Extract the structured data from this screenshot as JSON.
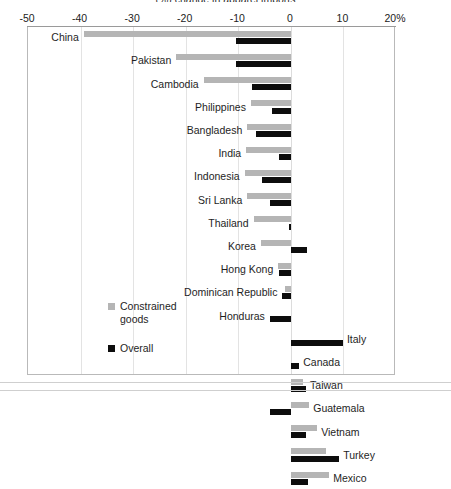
{
  "chart_data": {
    "type": "bar",
    "orientation": "horizontal",
    "title": "(%) change in apparel imports",
    "xlabel": "",
    "ylabel": "",
    "xlim": [
      -50,
      20
    ],
    "xticks": [
      -50,
      -40,
      -30,
      -20,
      -10,
      0,
      10,
      20
    ],
    "xticklabels": [
      "-50",
      "-40",
      "-30",
      "-20",
      "-10",
      "0",
      "10",
      "20%"
    ],
    "grid": "vertical",
    "legend_position": "inside-lower-left",
    "categories": [
      "China",
      "Pakistan",
      "Cambodia",
      "Philippines",
      "Bangladesh",
      "India",
      "Indonesia",
      "Sri Lanka",
      "Thailand",
      "Korea",
      "Hong Kong",
      "Dominican Republic",
      "Honduras",
      "Italy",
      "Canada",
      "Taiwan",
      "Guatemala",
      "Vietnam",
      "Turkey",
      "Mexico"
    ],
    "series": [
      {
        "name": "Constrained goods",
        "color": "#b5b5b5",
        "values": [
          -39.4,
          -21.8,
          -16.6,
          -7.6,
          -8.3,
          -8.5,
          -8.8,
          -8.3,
          -7.1,
          -5.7,
          -2.4,
          -1.2,
          0.0,
          0.0,
          0.0,
          2.4,
          3.5,
          5.0,
          6.6,
          7.3
        ]
      },
      {
        "name": "Overall",
        "color": "#0d0d0d",
        "values": [
          -10.4,
          -10.4,
          -7.3,
          -3.6,
          -6.7,
          -2.2,
          -5.5,
          -4.0,
          -0.3,
          3.1,
          -2.2,
          -1.6,
          -4.0,
          9.9,
          1.6,
          2.9,
          -4.0,
          2.9,
          9.2,
          3.3
        ]
      }
    ],
    "label_side": [
      "left",
      "left",
      "left",
      "left",
      "left",
      "left",
      "left",
      "left",
      "left",
      "left",
      "left",
      "left",
      "left",
      "right",
      "right",
      "right",
      "right",
      "right",
      "right",
      "right"
    ]
  },
  "legend": {
    "items": [
      {
        "label": "Constrained\ngoods",
        "swatch": "gray"
      },
      {
        "label": "Overall",
        "swatch": "black"
      }
    ]
  }
}
